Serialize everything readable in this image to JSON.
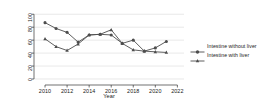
{
  "chart_data": {
    "type": "line",
    "title": "",
    "xlabel": "Year",
    "ylabel": "Transplants",
    "xlim": [
      2009,
      2022.6
    ],
    "ylim": [
      0,
      105
    ],
    "grid": true,
    "grid_axis": "y",
    "legend_position": "right",
    "x": [
      2010,
      2011,
      2012,
      2013,
      2014,
      2015,
      2016,
      2017,
      2018,
      2019,
      2020,
      2021
    ],
    "xticks": [
      2010,
      2012,
      2014,
      2016,
      2018,
      2020,
      2022
    ],
    "xtick_labels": [
      "2010",
      "2012",
      "2014",
      "2016",
      "2018",
      "2020",
      "2022"
    ],
    "yticks": [
      0,
      20,
      40,
      60,
      80,
      100
    ],
    "ytick_labels": [
      "0",
      "20",
      "40",
      "60",
      "80",
      "100"
    ],
    "series": [
      {
        "name": "Intestine without liver",
        "marker": "circle",
        "color": "#4d4d4d",
        "values": [
          87,
          78,
          72,
          57,
          68,
          69,
          68,
          55,
          60,
          43,
          48,
          58
        ]
      },
      {
        "name": "Intestine with liver",
        "marker": "triangle",
        "color": "#4d4d4d",
        "values": [
          62,
          50,
          44,
          54,
          68,
          69,
          76,
          55,
          45,
          43,
          42,
          41
        ]
      }
    ]
  },
  "legend": {
    "items": [
      {
        "label": "Intestine without liver",
        "marker": "circle"
      },
      {
        "label": "Intestine with liver",
        "marker": "triangle"
      }
    ]
  },
  "axes": {
    "x_title": "Year",
    "y_title": "Transplants"
  },
  "colors": {
    "series": "#4d4d4d",
    "grid": "#d9d9d9",
    "axis": "#333333",
    "text": "#1a1a1a",
    "background": "#ffffff"
  }
}
